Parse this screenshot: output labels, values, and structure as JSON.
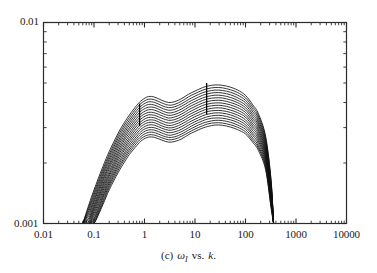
{
  "figure": {
    "caption_prefix": "(c)",
    "caption_symbol": "ω",
    "caption_subscript": "I",
    "caption_rest": "vs.",
    "caption_variable": "k",
    "caption_period": "."
  },
  "axes": {
    "y_top_label": "0.01",
    "y_bottom_label": "0.001",
    "x_labels": [
      "0.01",
      "0.1",
      "1",
      "10",
      "100",
      "1000",
      "10000"
    ]
  },
  "chart_data": {
    "type": "line",
    "title": "",
    "subtitle": "",
    "xlabel": "k",
    "ylabel": "ω_I",
    "xscale": "log",
    "yscale": "log",
    "xlim": [
      0.01,
      10000
    ],
    "ylim": [
      0.001,
      0.01
    ],
    "x_ticks": [
      0.01,
      0.1,
      1,
      10,
      100,
      1000,
      10000
    ],
    "x_tick_labels": [
      "0.01",
      "0.1",
      "1",
      "10",
      "100",
      "1000",
      "10000"
    ],
    "y_ticks": [
      0.001,
      0.01
    ],
    "y_tick_labels": [
      "0.001",
      "0.01"
    ],
    "grid": false,
    "legend": "none",
    "n_curves": 17,
    "x": [
      0.06,
      0.08,
      0.1,
      0.15,
      0.2,
      0.3,
      0.4,
      0.5,
      0.7,
      0.9,
      1.2,
      1.6,
      2.2,
      3.0,
      4.0,
      5.5,
      7.5,
      10,
      14,
      18,
      25,
      35,
      50,
      70,
      100,
      140,
      180,
      250,
      320,
      360
    ],
    "series": [
      {
        "name": "curve-1",
        "values": [
          0.001,
          0.00125,
          0.00147,
          0.00192,
          0.00228,
          0.00281,
          0.00318,
          0.00346,
          0.00387,
          0.00412,
          0.00428,
          0.00425,
          0.0041,
          0.004,
          0.00404,
          0.00419,
          0.0044,
          0.00456,
          0.00474,
          0.00483,
          0.00489,
          0.00487,
          0.00477,
          0.00461,
          0.00434,
          0.00389,
          0.00352,
          0.00272,
          0.00166,
          0.001
        ]
      },
      {
        "name": "curve-2",
        "values": [
          0.001,
          0.00122,
          0.00143,
          0.00186,
          0.00221,
          0.00273,
          0.00309,
          0.00336,
          0.00376,
          0.004,
          0.00415,
          0.00412,
          0.00398,
          0.00388,
          0.00392,
          0.00407,
          0.00427,
          0.00443,
          0.0046,
          0.00469,
          0.00475,
          0.00473,
          0.00463,
          0.00448,
          0.00422,
          0.00379,
          0.00343,
          0.00266,
          0.00163,
          0.001
        ]
      },
      {
        "name": "curve-3",
        "values": [
          0.001,
          0.00119,
          0.00139,
          0.00181,
          0.00215,
          0.00265,
          0.003,
          0.00326,
          0.00365,
          0.00388,
          0.00403,
          0.004,
          0.00386,
          0.00377,
          0.00381,
          0.00395,
          0.00414,
          0.0043,
          0.00447,
          0.00455,
          0.00461,
          0.00459,
          0.0045,
          0.00435,
          0.0041,
          0.00369,
          0.00334,
          0.00259,
          0.00159,
          0.001
        ]
      },
      {
        "name": "curve-4",
        "values": [
          0.001,
          0.00116,
          0.00135,
          0.00176,
          0.00209,
          0.00257,
          0.00291,
          0.00317,
          0.00354,
          0.00377,
          0.00391,
          0.00388,
          0.00375,
          0.00366,
          0.0037,
          0.00384,
          0.00402,
          0.00417,
          0.00434,
          0.00442,
          0.00448,
          0.00446,
          0.00437,
          0.00422,
          0.00399,
          0.00359,
          0.00325,
          0.00253,
          0.00156,
          0.001
        ]
      },
      {
        "name": "curve-5",
        "values": [
          0.001,
          0.00113,
          0.00131,
          0.00171,
          0.00203,
          0.0025,
          0.00283,
          0.00308,
          0.00344,
          0.00366,
          0.00379,
          0.00377,
          0.00364,
          0.00355,
          0.00359,
          0.00372,
          0.0039,
          0.00405,
          0.00421,
          0.00429,
          0.00435,
          0.00433,
          0.00424,
          0.0041,
          0.00388,
          0.00349,
          0.00317,
          0.00247,
          0.00153,
          0.001
        ]
      },
      {
        "name": "curve-6",
        "values": [
          0.001,
          0.0011,
          0.00128,
          0.00166,
          0.00197,
          0.00243,
          0.00275,
          0.00299,
          0.00334,
          0.00355,
          0.00368,
          0.00366,
          0.00354,
          0.00345,
          0.00349,
          0.00361,
          0.00379,
          0.00393,
          0.00409,
          0.00417,
          0.00422,
          0.00421,
          0.00412,
          0.00399,
          0.00377,
          0.0034,
          0.00309,
          0.00241,
          0.0015,
          0.001
        ]
      },
      {
        "name": "curve-7",
        "values": [
          0.001,
          0.00107,
          0.00124,
          0.00162,
          0.00192,
          0.00236,
          0.00267,
          0.00291,
          0.00324,
          0.00345,
          0.00357,
          0.00355,
          0.00344,
          0.00335,
          0.00339,
          0.00351,
          0.00368,
          0.00382,
          0.00397,
          0.00405,
          0.0041,
          0.00409,
          0.004,
          0.00388,
          0.00367,
          0.00331,
          0.00301,
          0.00235,
          0.00147,
          0.001
        ]
      },
      {
        "name": "curve-8",
        "values": [
          0.001,
          0.00105,
          0.00121,
          0.00157,
          0.00187,
          0.00229,
          0.0026,
          0.00282,
          0.00315,
          0.00335,
          0.00347,
          0.00345,
          0.00334,
          0.00326,
          0.00329,
          0.00341,
          0.00357,
          0.00371,
          0.00386,
          0.00393,
          0.00398,
          0.00397,
          0.00389,
          0.00377,
          0.00357,
          0.00322,
          0.00293,
          0.0023,
          0.00144,
          0.001
        ]
      },
      {
        "name": "curve-9",
        "values": [
          0.001,
          0.00103,
          0.00118,
          0.00153,
          0.00181,
          0.00223,
          0.00252,
          0.00274,
          0.00306,
          0.00325,
          0.00337,
          0.00335,
          0.00324,
          0.00316,
          0.0032,
          0.00331,
          0.00347,
          0.0036,
          0.00374,
          0.00382,
          0.00387,
          0.00386,
          0.00378,
          0.00366,
          0.00347,
          0.00313,
          0.00286,
          0.00224,
          0.00141,
          0.001
        ]
      },
      {
        "name": "curve-10",
        "values": [
          0.001,
          0.00101,
          0.00115,
          0.00149,
          0.00176,
          0.00217,
          0.00245,
          0.00266,
          0.00297,
          0.00316,
          0.00327,
          0.00326,
          0.00315,
          0.00307,
          0.00311,
          0.00322,
          0.00337,
          0.0035,
          0.00364,
          0.00371,
          0.00376,
          0.00375,
          0.00367,
          0.00356,
          0.00338,
          0.00305,
          0.00278,
          0.00219,
          0.00138,
          0.001
        ]
      },
      {
        "name": "curve-11",
        "values": [
          0.001,
          0.001,
          0.00112,
          0.00145,
          0.00172,
          0.00211,
          0.00238,
          0.00259,
          0.00288,
          0.00307,
          0.00318,
          0.00317,
          0.00306,
          0.00299,
          0.00302,
          0.00313,
          0.00327,
          0.0034,
          0.00353,
          0.00361,
          0.00365,
          0.00364,
          0.00357,
          0.00346,
          0.00328,
          0.00297,
          0.00271,
          0.00214,
          0.00135,
          0.001
        ]
      },
      {
        "name": "curve-12",
        "values": [
          0.001,
          0.001,
          0.00109,
          0.00141,
          0.00167,
          0.00205,
          0.00232,
          0.00252,
          0.0028,
          0.00298,
          0.00309,
          0.00308,
          0.00298,
          0.00291,
          0.00294,
          0.00304,
          0.00318,
          0.0033,
          0.00343,
          0.0035,
          0.00355,
          0.00354,
          0.00347,
          0.00336,
          0.00319,
          0.00289,
          0.00264,
          0.00209,
          0.00132,
          0.001
        ]
      },
      {
        "name": "curve-13",
        "values": [
          0.001,
          0.001,
          0.00106,
          0.00137,
          0.00163,
          0.00199,
          0.00225,
          0.00245,
          0.00272,
          0.0029,
          0.003,
          0.00299,
          0.0029,
          0.00283,
          0.00286,
          0.00295,
          0.00309,
          0.00321,
          0.00333,
          0.0034,
          0.00345,
          0.00344,
          0.00337,
          0.00327,
          0.0031,
          0.00281,
          0.00257,
          0.00204,
          0.0013,
          0.001
        ]
      },
      {
        "name": "curve-14",
        "values": [
          0.001,
          0.001,
          0.00104,
          0.00134,
          0.00159,
          0.00194,
          0.00219,
          0.00238,
          0.00265,
          0.00282,
          0.00292,
          0.00291,
          0.00282,
          0.00275,
          0.00278,
          0.00287,
          0.003,
          0.00312,
          0.00324,
          0.00331,
          0.00335,
          0.00334,
          0.00328,
          0.00318,
          0.00302,
          0.00274,
          0.0025,
          0.00199,
          0.00127,
          0.001
        ]
      },
      {
        "name": "curve-15",
        "values": [
          0.001,
          0.001,
          0.00102,
          0.0013,
          0.00155,
          0.00189,
          0.00213,
          0.00232,
          0.00258,
          0.00274,
          0.00284,
          0.00283,
          0.00274,
          0.00268,
          0.0027,
          0.00279,
          0.00292,
          0.00303,
          0.00315,
          0.00321,
          0.00326,
          0.00325,
          0.00319,
          0.00309,
          0.00294,
          0.00266,
          0.00243,
          0.00194,
          0.00125,
          0.001
        ]
      },
      {
        "name": "curve-16",
        "values": [
          0.001,
          0.001,
          0.001,
          0.00127,
          0.00151,
          0.00184,
          0.00208,
          0.00226,
          0.00251,
          0.00267,
          0.00276,
          0.00275,
          0.00267,
          0.00261,
          0.00263,
          0.00272,
          0.00284,
          0.00295,
          0.00306,
          0.00313,
          0.00317,
          0.00316,
          0.0031,
          0.00301,
          0.00286,
          0.00259,
          0.00237,
          0.0019,
          0.00122,
          0.001
        ]
      },
      {
        "name": "curve-17",
        "values": [
          0.001,
          0.001,
          0.001,
          0.00124,
          0.00147,
          0.00179,
          0.00202,
          0.0022,
          0.00244,
          0.0026,
          0.00269,
          0.00268,
          0.0026,
          0.00254,
          0.00256,
          0.00264,
          0.00277,
          0.00287,
          0.00298,
          0.00304,
          0.00309,
          0.00308,
          0.00302,
          0.00293,
          0.00279,
          0.00253,
          0.00231,
          0.00185,
          0.0012,
          0.001
        ]
      }
    ],
    "annotations": [
      {
        "name": "marker-left",
        "type": "vertical-line",
        "x": 0.8,
        "y_start": 0.00305,
        "y_end": 0.00395
      },
      {
        "name": "marker-right",
        "type": "vertical-line",
        "x": 17,
        "y_start": 0.0035,
        "y_end": 0.005
      }
    ]
  }
}
